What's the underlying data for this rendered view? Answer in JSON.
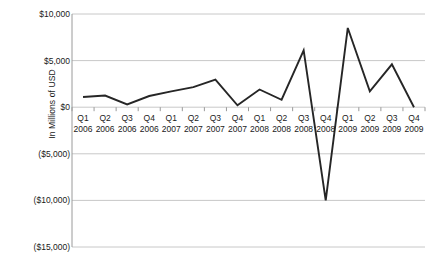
{
  "chart_data": {
    "type": "line",
    "title": "",
    "xlabel": "",
    "ylabel": "In Millions of USD",
    "ylim": [
      -15000,
      10000
    ],
    "grid": true,
    "legend": "none",
    "ytick_labels": [
      "$10,000",
      "$5,000",
      "$0",
      "($5,000)",
      "($10,000)",
      "($15,000)"
    ],
    "ytick_values": [
      10000,
      5000,
      0,
      -5000,
      -10000,
      -15000
    ],
    "categories": [
      "Q1 2006",
      "Q2 2006",
      "Q3 2006",
      "Q4 2006",
      "Q1 2007",
      "Q2 2007",
      "Q3 2007",
      "Q4 2007",
      "Q1 2008",
      "Q2 2008",
      "Q3 2008",
      "Q4 2008",
      "Q1 2009",
      "Q2 2009",
      "Q3 2009",
      "Q4 2009"
    ],
    "category_quarters": [
      "Q1",
      "Q2",
      "Q3",
      "Q4",
      "Q1",
      "Q2",
      "Q3",
      "Q4",
      "Q1",
      "Q2",
      "Q3",
      "Q4",
      "Q1",
      "Q2",
      "Q3",
      "Q4"
    ],
    "category_years": [
      "2006",
      "2006",
      "2006",
      "2006",
      "2007",
      "2007",
      "2007",
      "2007",
      "2008",
      "2008",
      "2008",
      "2008",
      "2009",
      "2009",
      "2009",
      "2009"
    ],
    "values": [
      1100,
      1250,
      300,
      1200,
      1700,
      2150,
      2950,
      200,
      1900,
      800,
      6100,
      -10000,
      8500,
      1700,
      4600,
      0
    ],
    "series": [
      {
        "name": "Value",
        "color": "#262626",
        "values": [
          1100,
          1250,
          300,
          1200,
          1700,
          2150,
          2950,
          200,
          1900,
          800,
          6100,
          -10000,
          8500,
          1700,
          4600,
          0
        ]
      }
    ],
    "colors": {
      "line": "#262626",
      "grid": "#c8c8c8",
      "axis": "#9a9a9a",
      "background": "#ffffff",
      "text": "#1a1a1a"
    }
  }
}
